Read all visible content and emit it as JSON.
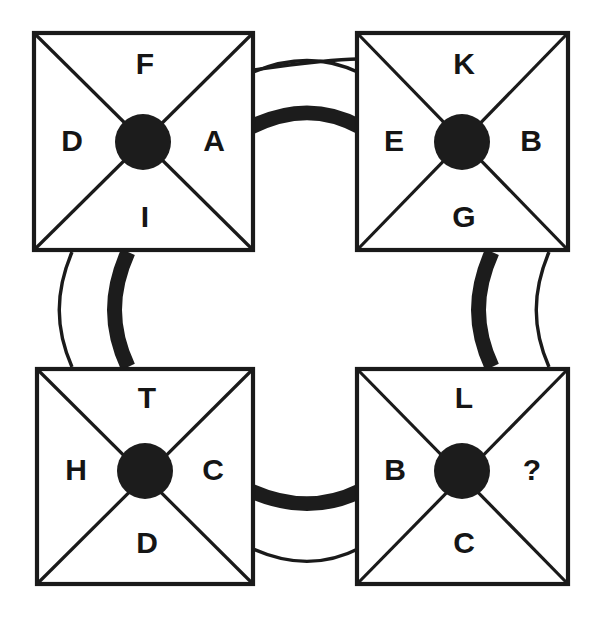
{
  "diagram": {
    "type": "letter-cross-boxes",
    "canvas": {
      "width": 598,
      "height": 620
    },
    "background_color": "#ffffff",
    "ink_color": "#1a1a1a",
    "hub_color": "#1c1c1c",
    "boxes": [
      {
        "id": "box-top-left",
        "position": "top-left",
        "x": 34,
        "y": 33,
        "size": 219,
        "hub": {
          "cx": 143,
          "cy": 142,
          "r": 27
        },
        "letters": {
          "top": "F",
          "left": "D",
          "right": "A",
          "bottom": "I"
        }
      },
      {
        "id": "box-top-right",
        "position": "top-right",
        "x": 357,
        "y": 33,
        "size": 211,
        "hub": {
          "cx": 462,
          "cy": 142,
          "r": 27
        },
        "letters": {
          "top": "K",
          "left": "E",
          "right": "B",
          "bottom": "G"
        }
      },
      {
        "id": "box-bottom-left",
        "position": "bottom-left",
        "x": 37,
        "y": 369,
        "size": 216,
        "hub": {
          "cx": 145,
          "cy": 471,
          "r": 27
        },
        "letters": {
          "top": "T",
          "left": "H",
          "right": "C",
          "bottom": "D"
        }
      },
      {
        "id": "box-bottom-right",
        "position": "bottom-right",
        "x": 357,
        "y": 369,
        "size": 211,
        "hub": {
          "cx": 462,
          "cy": 471,
          "r": 27
        },
        "letters": {
          "top": "L",
          "left": "B",
          "right": "?",
          "bottom": "C"
        }
      }
    ],
    "connectors": [
      {
        "id": "connector-top",
        "orientation": "horizontal",
        "from": "box-top-left",
        "to": "box-top-right",
        "thin_label": "thin-arc",
        "thick_label": "thick-arc"
      },
      {
        "id": "connector-left",
        "orientation": "vertical",
        "from": "box-top-left",
        "to": "box-bottom-left",
        "thin_label": "thin-arc",
        "thick_label": "thick-arc"
      },
      {
        "id": "connector-right",
        "orientation": "vertical",
        "from": "box-top-right",
        "to": "box-bottom-right",
        "thin_label": "thin-arc",
        "thick_label": "thick-arc"
      },
      {
        "id": "connector-bottom",
        "orientation": "horizontal",
        "from": "box-bottom-left",
        "to": "box-bottom-right",
        "thin_label": "thin-arc",
        "thick_label": "thick-arc"
      }
    ],
    "unknown_marker": "?"
  }
}
